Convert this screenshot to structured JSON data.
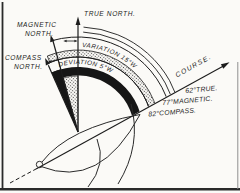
{
  "figure": {
    "colors": {
      "ink": "#1c1c1c",
      "paper": "#fbfaf7"
    },
    "labels": {
      "true_north": "TRUE NORTH.",
      "magnetic_north_l1": "MAGNETIC",
      "magnetic_north_l2": "NORTH.",
      "compass_north_l1": "COMPASS",
      "compass_north_l2": "NORTH.",
      "variation_arc": "VARIATION 15°W",
      "deviation_arc": "DEVIATION 5°W",
      "course": "COURSE.",
      "course_true": "62°TRUE.",
      "course_magnetic": "77°MAGNETIC.",
      "course_compass": "82°COMPASS."
    },
    "values": {
      "variation": "15°W",
      "deviation": "5°W",
      "true_course": "62°",
      "magnetic_course": "77°",
      "compass_course": "82°"
    }
  }
}
